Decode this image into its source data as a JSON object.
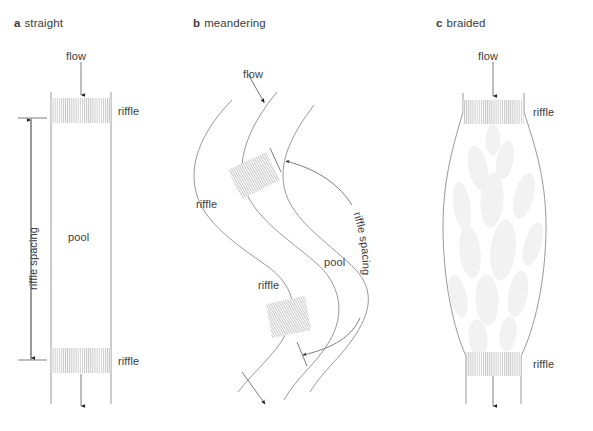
{
  "figure": {
    "background": "#ffffff",
    "ink_color": "#6e6e6e",
    "text_color": "#3c3c3c",
    "riffle_hatch_color": "#c9c9c9",
    "bar_fill_color": "#f3f3f3",
    "width": 593,
    "height": 431
  },
  "panels": [
    {
      "id": "a",
      "index_label": "a",
      "name": "straight",
      "label_x": 14,
      "label_y": 24,
      "annotations": {
        "flow": "flow",
        "pool": "pool",
        "riffle_upper": "riffle",
        "riffle_lower": "riffle",
        "spacing": "riffle spacing"
      }
    },
    {
      "id": "b",
      "index_label": "b",
      "name": "meandering",
      "label_x": 193,
      "label_y": 24,
      "annotations": {
        "flow": "flow",
        "pool": "pool",
        "riffle_upper": "riffle",
        "riffle_lower": "riffle",
        "spacing": "riffle spacing"
      }
    },
    {
      "id": "c",
      "index_label": "c",
      "name": "braided",
      "label_x": 436,
      "label_y": 24,
      "annotations": {
        "flow": "flow",
        "riffle_upper": "riffle",
        "riffle_lower": "riffle"
      }
    }
  ]
}
